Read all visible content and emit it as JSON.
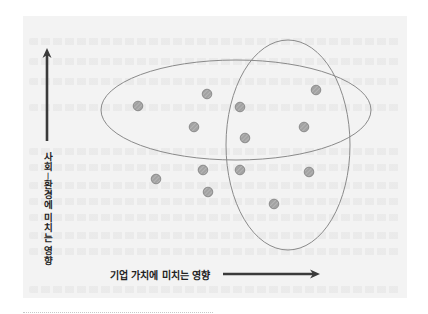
{
  "diagram": {
    "y_axis": {
      "label": "사회·환경에 미치는 영향",
      "chars": [
        "사",
        "회",
        "-",
        "환",
        "경",
        "에",
        "",
        "미",
        "치",
        "는",
        "",
        "영",
        "향"
      ],
      "arrow": {
        "x": 47,
        "y_tail": 141,
        "y_head": 48
      }
    },
    "x_axis": {
      "label": "기업 가치에 미치는 영향",
      "arrow": {
        "y": 274,
        "x_tail": 223,
        "x_head": 320
      }
    },
    "ellipses": [
      {
        "name": "horizontal-ellipse",
        "cx": 236,
        "cy": 110,
        "rx": 135,
        "ry": 50
      },
      {
        "name": "vertical-ellipse",
        "cx": 288,
        "cy": 145,
        "rx": 62,
        "ry": 105
      }
    ],
    "points": [
      {
        "x": 138,
        "y": 106
      },
      {
        "x": 207,
        "y": 94
      },
      {
        "x": 240,
        "y": 107
      },
      {
        "x": 316,
        "y": 90
      },
      {
        "x": 194,
        "y": 127
      },
      {
        "x": 304,
        "y": 127
      },
      {
        "x": 245,
        "y": 138
      },
      {
        "x": 156,
        "y": 179
      },
      {
        "x": 203,
        "y": 170
      },
      {
        "x": 240,
        "y": 170
      },
      {
        "x": 309,
        "y": 172
      },
      {
        "x": 208,
        "y": 192
      },
      {
        "x": 274,
        "y": 204
      }
    ],
    "colors": {
      "panel": "#f3f3f3",
      "ellipse_stroke": "#8a8a8a",
      "point_fill": "#a2a2a2",
      "point_stroke": "#7c7c7c",
      "arrow": "#3a3a3a",
      "text": "#222222"
    }
  }
}
